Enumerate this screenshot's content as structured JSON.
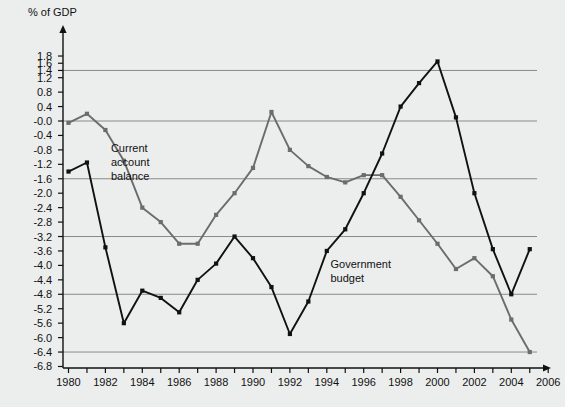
{
  "chart_data": {
    "type": "line",
    "title": "",
    "ylabel": "% of GDP",
    "xlabel": "",
    "ylim": [
      -7.0,
      2.0
    ],
    "xlim": [
      1979.3,
      2007.4
    ],
    "grid": true,
    "grid_values": [
      1.4,
      -0.0,
      -1.6,
      -3.2,
      -4.8,
      -6.4
    ],
    "ytick_labels": [
      "1.8",
      "1.6",
      "1.4",
      "1.2",
      "0.8",
      "0.4",
      "-0.0",
      "-0.4",
      "-0.8",
      "-1.2",
      "-1.6",
      "-2.0",
      "-2.4",
      "-2.8",
      "-3.2",
      "-3.6",
      "-4.0",
      "-4.4",
      "-4.8",
      "-5.2",
      "-5.6",
      "-6.0",
      "-6.4",
      "-6.8"
    ],
    "ytick_values": [
      1.8,
      1.6,
      1.4,
      1.2,
      0.8,
      0.4,
      -0.0,
      -0.4,
      -0.8,
      -1.2,
      -1.6,
      -2.0,
      -2.4,
      -2.8,
      -3.2,
      -3.6,
      -4.0,
      -4.4,
      -4.8,
      -5.2,
      -5.6,
      -6.0,
      -6.4,
      -6.8
    ],
    "xtick_labels": [
      "1980",
      "1982",
      "1984",
      "1986",
      "1988",
      "1990",
      "1992",
      "1994",
      "1996",
      "1998",
      "2000",
      "2002",
      "2004",
      "2006"
    ],
    "xtick_values": [
      1980,
      1982,
      1984,
      1986,
      1988,
      1990,
      1992,
      1994,
      1996,
      1998,
      2000,
      2002,
      2004,
      2006
    ],
    "xminor_values": [
      1980,
      1981,
      1982,
      1983,
      1984,
      1985,
      1986,
      1987,
      1988,
      1989,
      1990,
      1991,
      1992,
      1993,
      1994,
      1995,
      1996,
      1997,
      1998,
      1999,
      2000,
      2001,
      2002,
      2003,
      2004,
      2005,
      2006
    ],
    "legend_position": "inline-annotations",
    "series": [
      {
        "name": "Current account balance",
        "color": "#6c6c6c",
        "label_text": "Current\naccount\nbalance",
        "label_x": 1982.3,
        "label_y": -0.75,
        "x": [
          1980,
          1981,
          1982,
          1983,
          1984,
          1985,
          1986,
          1987,
          1988,
          1989,
          1990,
          1991,
          1992,
          1993,
          1994,
          1995,
          1996,
          1997,
          1998,
          1999,
          2000,
          2001,
          2002,
          2003,
          2004,
          2005
        ],
        "values": [
          -0.05,
          0.2,
          -0.25,
          -1.1,
          -2.4,
          -2.8,
          -3.4,
          -3.4,
          -2.6,
          -2.0,
          -1.3,
          0.25,
          -0.8,
          -1.25,
          -1.55,
          -1.7,
          -1.5,
          -1.5,
          -2.1,
          -2.75,
          -3.4,
          -4.1,
          -3.8,
          -4.3,
          -5.5,
          -6.4
        ],
        "marker": "square"
      },
      {
        "name": "Government budget",
        "color": "#111111",
        "label_text": "Government\nbudget",
        "label_x": 1994.2,
        "label_y": -3.95,
        "x": [
          1980,
          1981,
          1982,
          1983,
          1984,
          1985,
          1986,
          1987,
          1988,
          1989,
          1990,
          1991,
          1992,
          1993,
          1994,
          1995,
          1996,
          1997,
          1998,
          1999,
          2000,
          2001,
          2002,
          2003,
          2004,
          2005
        ],
        "values": [
          -1.4,
          -1.15,
          -3.5,
          -5.6,
          -4.7,
          -4.9,
          -5.3,
          -4.4,
          -3.95,
          -3.2,
          -3.8,
          -4.6,
          -5.9,
          -5.0,
          -3.6,
          -3.0,
          -2.0,
          -0.9,
          0.4,
          1.05,
          1.65,
          0.1,
          -2.0,
          -3.55,
          -4.8,
          -3.55
        ],
        "marker": "square"
      }
    ]
  },
  "axis": {
    "y_title": "% of GDP"
  }
}
